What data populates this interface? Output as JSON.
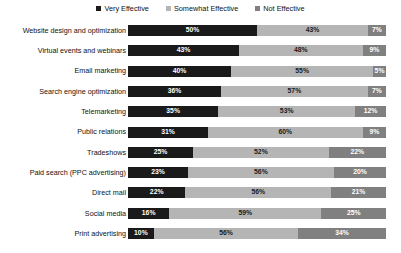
{
  "chart_data": {
    "type": "bar",
    "title": "",
    "subtitle": "",
    "xlabel": "",
    "ylabel": "",
    "orientation": "horizontal",
    "stacked": true,
    "stack_mode": "percent",
    "grid": false,
    "legend_position": "top-center",
    "xlim": [
      0,
      100
    ],
    "categories": [
      "Website design and optimization",
      "Virtual events and webinars",
      "Email marketing",
      "Search engine optimization",
      "Telemarketing",
      "Public relations",
      "Tradeshows",
      "Paid search (PPC advertising)",
      "Direct mail",
      "Social media",
      "Print advertising"
    ],
    "series": [
      {
        "name": "Very Effective",
        "color": "#1a1a1a",
        "values": [
          50,
          43,
          40,
          36,
          35,
          31,
          25,
          23,
          22,
          16,
          10
        ],
        "labels": [
          "50%",
          "43%",
          "40%",
          "36%",
          "35%",
          "31%",
          "25%",
          "23%",
          "22%",
          "16%",
          "10%"
        ]
      },
      {
        "name": "Somewhat Effective",
        "color": "#b5b5b5",
        "values": [
          43,
          48,
          55,
          57,
          53,
          60,
          52,
          56,
          56,
          59,
          56
        ],
        "labels": [
          "43%",
          "48%",
          "55%",
          "57%",
          "53%",
          "60%",
          "52%",
          "56%",
          "56%",
          "59%",
          "56%"
        ]
      },
      {
        "name": "Not Effective",
        "color": "#808080",
        "values": [
          7,
          9,
          5,
          7,
          12,
          9,
          22,
          20,
          21,
          25,
          34
        ],
        "labels": [
          "7%",
          "9%",
          "5%",
          "7%",
          "12%",
          "9%",
          "22%",
          "20%",
          "21%",
          "25%",
          "34%"
        ]
      }
    ]
  },
  "legend": {
    "items": [
      {
        "label": "Very Effective",
        "color": "#1a1a1a"
      },
      {
        "label": "Somewhat Effective",
        "color": "#b5b5b5"
      },
      {
        "label": "Not Effective",
        "color": "#808080"
      }
    ]
  }
}
